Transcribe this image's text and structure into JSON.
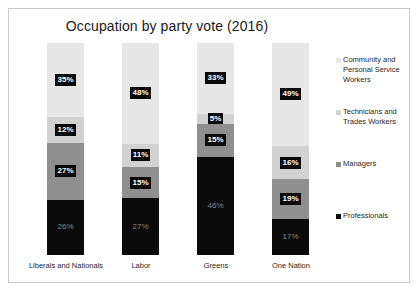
{
  "chart_data": {
    "type": "bar",
    "stacked": true,
    "title": "Occupation by party vote (2016)",
    "xlabel": "",
    "ylabel": "",
    "ylim": [
      0,
      100
    ],
    "grid": false,
    "legend_position": "right",
    "categories": [
      "Liberals and Nationals",
      "Labor",
      "Greens",
      "One Nation"
    ],
    "series": [
      {
        "name": "Community and Personal Service Workers",
        "color": "#e7e7e7",
        "values": [
          35,
          48,
          33,
          49
        ],
        "labels": [
          "35%",
          "48%",
          "33%",
          "49%"
        ]
      },
      {
        "name": "Technicians and Trades Workers",
        "color": "#d2d2d2",
        "values": [
          12,
          11,
          5,
          16
        ],
        "labels": [
          "12%",
          "11%",
          "5%",
          "16%"
        ]
      },
      {
        "name": "Managers",
        "color": "#8f8f8f",
        "values": [
          27,
          15,
          15,
          19
        ],
        "labels": [
          "27%",
          "15%",
          "15%",
          "19%"
        ]
      },
      {
        "name": "Professionals",
        "color": "#0a0a0a",
        "values": [
          26,
          27,
          46,
          17
        ],
        "labels": [
          "26%",
          "27%",
          "46%",
          "17%"
        ]
      }
    ]
  }
}
